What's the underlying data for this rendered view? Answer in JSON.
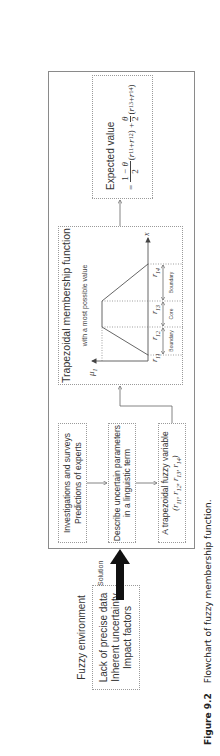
{
  "fuzzy_environment": {
    "title": "Fuzzy environment",
    "items": [
      "Lack of precise data",
      "Inherent uncertainty",
      "Impact factors"
    ]
  },
  "solution_label": "Solution",
  "left_column": {
    "box1": [
      "Investigations and surveys",
      "Predictions of experts"
    ],
    "box2": [
      "Describe uncertain parameters",
      "in a linguistic term"
    ],
    "box3": {
      "line1": "A trapezoidal fuzzy variable",
      "line2": "(r11, r12, r13, r14)"
    }
  },
  "trapezoid": {
    "title": "Trapezoidal membership function",
    "subtitle": "with a most possible value",
    "y_axis_label": "μ1",
    "x_axis_label": "x",
    "points": [
      "r11",
      "r12",
      "r13",
      "r14"
    ],
    "segments": [
      "Boundary",
      "Core",
      "Boundary"
    ]
  },
  "expected_value": {
    "title": "Expected value",
    "formula": "= (1−θ)/2 (r11 + r12) + θ/2 (r13 + r14)"
  },
  "caption": {
    "label": "Figure 9.2",
    "text": "Flowchart of fuzzy membership function."
  }
}
